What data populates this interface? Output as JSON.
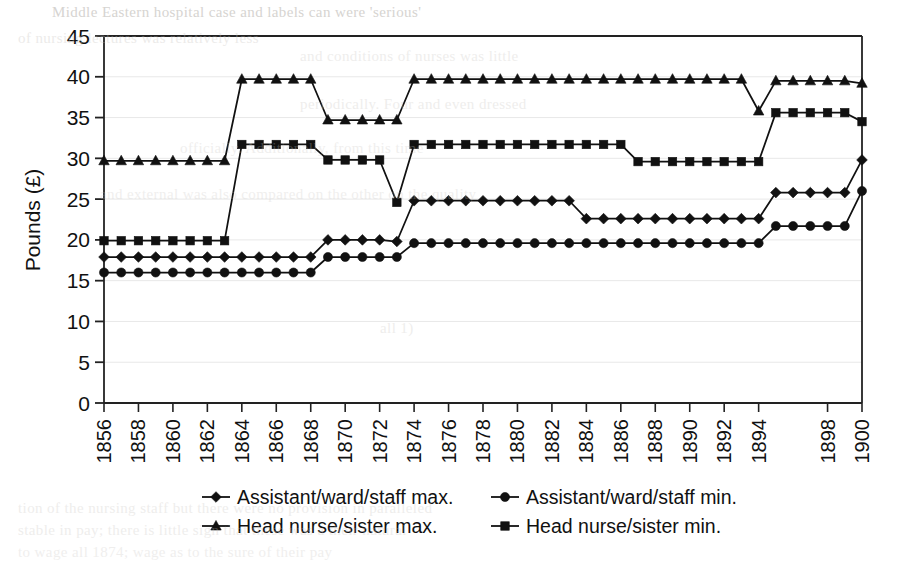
{
  "chart_data": {
    "type": "line",
    "title": "",
    "subtitle": "",
    "xlabel": "",
    "ylabel": "Pounds (£)",
    "ylim": [
      0,
      45
    ],
    "yticks": [
      0,
      5,
      10,
      15,
      20,
      25,
      30,
      35,
      40,
      45
    ],
    "ytick_labels": [
      "0",
      "5",
      "10",
      "15",
      "20",
      "25",
      "30",
      "35",
      "40",
      "45"
    ],
    "xlim": [
      1856,
      1900
    ],
    "xtick_labels": [
      "1856",
      "1858",
      "1860",
      "1862",
      "1864",
      "1866",
      "1868",
      "1870",
      "1872",
      "1874",
      "1876",
      "1878",
      "1880",
      "1882",
      "1884",
      "1886",
      "1888",
      "1890",
      "1892",
      "1894",
      "1898",
      "1900"
    ],
    "grid": "horizontal",
    "legend_position": "bottom",
    "x": [
      1856,
      1857,
      1858,
      1859,
      1860,
      1861,
      1862,
      1863,
      1864,
      1865,
      1866,
      1867,
      1868,
      1869,
      1870,
      1871,
      1872,
      1873,
      1874,
      1875,
      1876,
      1877,
      1878,
      1879,
      1880,
      1881,
      1882,
      1883,
      1884,
      1885,
      1886,
      1887,
      1888,
      1889,
      1890,
      1891,
      1892,
      1893,
      1894,
      1895,
      1896,
      1897,
      1898,
      1899,
      1900
    ],
    "series": [
      {
        "name": "Assistant/ward/staff max.",
        "marker": "diamond",
        "values": [
          17.9,
          17.9,
          17.9,
          17.9,
          17.9,
          17.9,
          17.9,
          17.9,
          17.9,
          17.9,
          17.9,
          17.9,
          17.9,
          20.0,
          20.0,
          20.0,
          20.0,
          19.8,
          24.8,
          24.8,
          24.8,
          24.8,
          24.8,
          24.8,
          24.8,
          24.8,
          24.8,
          24.8,
          22.6,
          22.6,
          22.6,
          22.6,
          22.6,
          22.6,
          22.6,
          22.6,
          22.6,
          22.6,
          22.6,
          25.8,
          25.8,
          25.8,
          25.8,
          25.8,
          29.8
        ]
      },
      {
        "name": "Assistant/ward/staff min.",
        "marker": "circle",
        "values": [
          16.0,
          16.0,
          16.0,
          16.0,
          16.0,
          16.0,
          16.0,
          16.0,
          16.0,
          16.0,
          16.0,
          16.0,
          16.0,
          17.9,
          17.9,
          17.9,
          17.9,
          17.9,
          19.6,
          19.6,
          19.6,
          19.6,
          19.6,
          19.6,
          19.6,
          19.6,
          19.6,
          19.6,
          19.6,
          19.6,
          19.6,
          19.6,
          19.6,
          19.6,
          19.6,
          19.6,
          19.6,
          19.6,
          19.6,
          21.7,
          21.7,
          21.7,
          21.7,
          21.7,
          26.0
        ]
      },
      {
        "name": "Head nurse/sister max.",
        "marker": "triangle",
        "values": [
          29.7,
          29.7,
          29.7,
          29.7,
          29.7,
          29.7,
          29.7,
          29.7,
          39.7,
          39.7,
          39.7,
          39.7,
          39.7,
          34.7,
          34.7,
          34.7,
          34.7,
          34.7,
          39.7,
          39.7,
          39.7,
          39.7,
          39.7,
          39.7,
          39.7,
          39.7,
          39.7,
          39.7,
          39.7,
          39.7,
          39.7,
          39.7,
          39.7,
          39.7,
          39.7,
          39.7,
          39.7,
          39.7,
          35.8,
          39.5,
          39.5,
          39.5,
          39.5,
          39.5,
          39.2
        ]
      },
      {
        "name": "Head nurse/sister min.",
        "marker": "square",
        "values": [
          19.9,
          19.9,
          19.9,
          19.9,
          19.9,
          19.9,
          19.9,
          19.9,
          31.7,
          31.7,
          31.7,
          31.7,
          31.7,
          29.8,
          29.8,
          29.8,
          29.8,
          24.6,
          31.7,
          31.7,
          31.7,
          31.7,
          31.7,
          31.7,
          31.7,
          31.7,
          31.7,
          31.7,
          31.7,
          31.7,
          31.7,
          29.6,
          29.6,
          29.6,
          29.6,
          29.6,
          29.6,
          29.6,
          29.6,
          35.6,
          35.6,
          35.6,
          35.6,
          35.6,
          34.5
        ]
      }
    ]
  },
  "legend": {
    "entries": [
      {
        "label": "Assistant/ward/staff max.",
        "marker": "diamond"
      },
      {
        "label": "Assistant/ward/staff min.",
        "marker": "circle"
      },
      {
        "label": "Head nurse/sister max.",
        "marker": "triangle"
      },
      {
        "label": "Head nurse/sister min.",
        "marker": "square"
      }
    ]
  },
  "colors": {
    "series": "#111111",
    "axis": "#222222",
    "grid": "#e8e8e8",
    "background": "#ffffff",
    "bleed_text": "#c9c6c2"
  },
  "scan_artifacts": {
    "top_line": "Middle Eastern hospital case   and labels can were 'serious'",
    "row2": "of nursing lectures was relatively less",
    "row3": "and conditions of nurses was little",
    "row4": "periodically. Four and even dressed",
    "row5": "officially. Additionally, from this time",
    "row6": "and external was also compared on the other on the quality",
    "row7": "all 1)",
    "row8": "tion of the nursing staff but there were no provision in paralleled",
    "row9": "stable in pay; there is little sign that these was a their natural",
    "row10": "to wage all 1874; wage as to the sure of their pay"
  }
}
